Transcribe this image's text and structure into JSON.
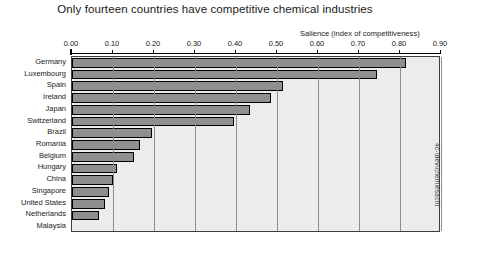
{
  "chart_data": {
    "type": "bar",
    "orientation": "horizontal",
    "title": "Only fourteen countries have competitive chemical industries",
    "xlabel": "Salience (index of competitiveness)",
    "ylabel": "",
    "xlim": [
      0.0,
      0.9
    ],
    "grid": true,
    "legend": null,
    "tick_labels": [
      "0.00",
      "0.10",
      "0.20",
      "0.30",
      "0.40",
      "0.50",
      "0.60",
      "0.70",
      "0.80",
      "0.90"
    ],
    "tick_values": [
      0.0,
      0.1,
      0.2,
      0.3,
      0.4,
      0.5,
      0.6,
      0.7,
      0.8,
      0.9
    ],
    "categories": [
      "Germany",
      "Luxembourg",
      "Spain",
      "Ireland",
      "Japan",
      "Switzerland",
      "Brazil",
      "Romania",
      "Belgium",
      "Hungary",
      "China",
      "Singapore",
      "United States",
      "Netherlands",
      "Malaysia"
    ],
    "values": [
      0.815,
      0.745,
      0.515,
      0.485,
      0.435,
      0.395,
      0.195,
      0.165,
      0.15,
      0.11,
      0.1,
      0.09,
      0.08,
      0.065,
      0.0
    ],
    "annotations": {
      "side_note": "4c-\\dev\\chemiesacht"
    },
    "colors": {
      "bar_fill": "#8f8f8f",
      "bar_border": "#000000",
      "plot_background": "#ececec",
      "gridline": "#8c8c8c",
      "axis": "#000000",
      "text": "#1a1a1a"
    }
  }
}
